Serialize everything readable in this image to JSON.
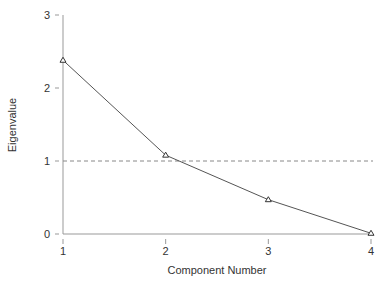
{
  "chart_data": {
    "type": "line",
    "title": "",
    "xlabel": "Component Number",
    "ylabel": "Eigenvalue",
    "x": [
      1,
      2,
      3,
      4
    ],
    "values": [
      2.38,
      1.08,
      0.47,
      0.01
    ],
    "xticks": [
      "1",
      "2",
      "3",
      "4"
    ],
    "yticks": [
      "0",
      "1",
      "2",
      "3"
    ],
    "xlim": [
      1,
      4
    ],
    "ylim": [
      0,
      3
    ],
    "reference_line": {
      "y": 1,
      "style": "dashed"
    },
    "marker": "triangle-open",
    "grid": false,
    "legend": null
  },
  "colors": {
    "line": "#555555",
    "axis": "#999999",
    "reference": "#888888",
    "text": "#333333"
  }
}
